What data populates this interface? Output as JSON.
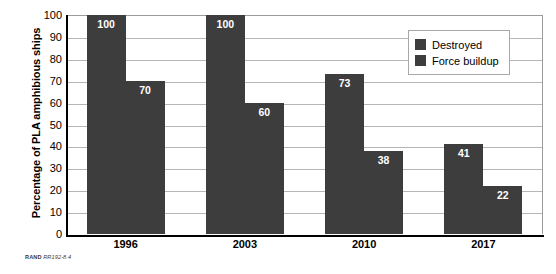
{
  "chart_data": {
    "type": "bar",
    "title": "",
    "subtitle": "",
    "xlabel": "",
    "ylabel": "Percentage of PLA amphibious ships",
    "categories": [
      "1996",
      "2003",
      "2010",
      "2017"
    ],
    "series": [
      {
        "name": "Destroyed",
        "values": [
          100,
          100,
          73,
          41
        ],
        "color": "#3d3d3d"
      },
      {
        "name": "Force buildup",
        "values": [
          70,
          60,
          38,
          22
        ],
        "color": "#3d3d3d"
      }
    ],
    "ylim": [
      0,
      100
    ],
    "ytick_step": 10,
    "yticks": [
      100,
      90,
      80,
      70,
      60,
      50,
      40,
      30,
      20,
      10,
      0
    ],
    "grid": true,
    "grid_axis": "y",
    "legend_position": "top-right",
    "data_labels": true,
    "data_label_color": "#ffffff"
  },
  "legend": {
    "items": [
      {
        "label": "Destroyed",
        "swatch_color": "#3d3d3d"
      },
      {
        "label": "Force buildup",
        "swatch_color": "#3d3d3d"
      }
    ]
  },
  "footnote": {
    "source_label": "RAND",
    "figure_id": "RR192-8.4"
  },
  "colors": {
    "bar": "#3d3d3d",
    "gridline": "#b6b6b6",
    "axis": "#000000",
    "plot_border": "#9b9b9b",
    "background": "#ffffff"
  }
}
